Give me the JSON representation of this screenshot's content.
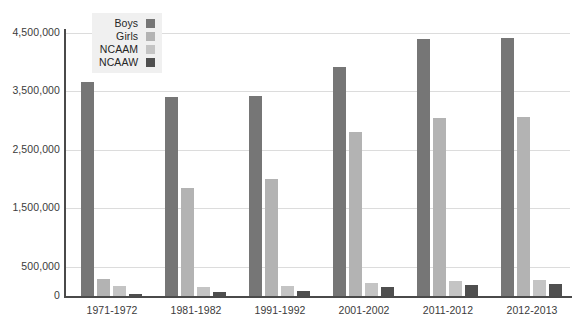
{
  "chart_data": {
    "type": "bar",
    "title": "",
    "subtitle": "",
    "xlabel": "",
    "ylabel": "",
    "ylim": [
      0,
      4500000
    ],
    "grid": true,
    "legend_position": "top-left",
    "y_ticks": [
      {
        "value": 4500000,
        "label": "4,500,000"
      },
      {
        "value": 3500000,
        "label": "3,500,000"
      },
      {
        "value": 2500000,
        "label": "2,500,000"
      },
      {
        "value": 1500000,
        "label": "1,500,000"
      },
      {
        "value": 500000,
        "label": "500,000"
      },
      {
        "value": 0,
        "label": "0"
      }
    ],
    "categories": [
      "1971-1972",
      "1981-1982",
      "1991-1992",
      "2001-2002",
      "2011-2012",
      "2012-2013"
    ],
    "series": [
      {
        "name": "Boys",
        "color": "#767676",
        "values": [
          3670000,
          3410000,
          3430000,
          3920000,
          4390000,
          4420000
        ]
      },
      {
        "name": "Girls",
        "color": "#b3b3b3",
        "values": [
          295000,
          1850000,
          2000000,
          2810000,
          3050000,
          3070000
        ]
      },
      {
        "name": "NCAAM",
        "color": "#c4c4c4",
        "values": [
          170000,
          150000,
          175000,
          220000,
          255000,
          275000
        ]
      },
      {
        "name": "NCAAW",
        "color": "#4f4f4f",
        "values": [
          30000,
          65000,
          90000,
          155000,
          195000,
          205000
        ]
      }
    ]
  },
  "legend": {
    "items": [
      {
        "label": "Boys",
        "color": "#767676"
      },
      {
        "label": "Girls",
        "color": "#b3b3b3"
      },
      {
        "label": "NCAAM",
        "color": "#c4c4c4"
      },
      {
        "label": "NCAAW",
        "color": "#4f4f4f"
      }
    ]
  },
  "watermark": {
    "text": " "
  }
}
